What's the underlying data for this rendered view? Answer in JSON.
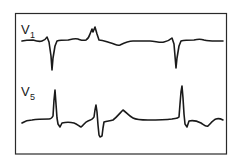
{
  "figure": {
    "type": "ECG tracing diagram",
    "background_color": "#ffffff",
    "frame_color": "#2a2a2a",
    "trace_color": "#1a1a1a",
    "leads": [
      {
        "id": "V1",
        "label_main": "V",
        "label_sub": "1",
        "description": "Lead V1: baseline with deep negative QRS deflections and a notched positive complex between them"
      },
      {
        "id": "V5",
        "label_main": "V",
        "label_sub": "5",
        "description": "Lead V5: tall narrow positive R waves with a wide biphasic complex and rounded T wave between them"
      }
    ]
  }
}
